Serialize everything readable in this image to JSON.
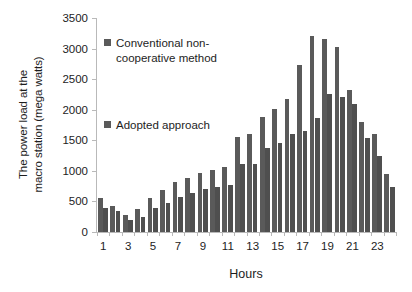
{
  "chart_data": {
    "type": "bar",
    "title": "",
    "xlabel": "Hours",
    "ylabel": "The power load at the macro station (mega watts)",
    "ylabel_line1": "The power load at the",
    "ylabel_line2": "macro station (mega watts)",
    "ylim": [
      0,
      3500
    ],
    "ytick_step": 500,
    "yticks": [
      0,
      500,
      1000,
      1500,
      2000,
      2500,
      3000,
      3500
    ],
    "categories": [
      1,
      2,
      3,
      4,
      5,
      6,
      7,
      8,
      9,
      10,
      11,
      12,
      13,
      14,
      15,
      16,
      17,
      18,
      19,
      20,
      21,
      22,
      23,
      24
    ],
    "xticklabels": [
      "1",
      "3",
      "5",
      "7",
      "9",
      "11",
      "13",
      "15",
      "17",
      "19",
      "21",
      "23"
    ],
    "xtick_positions": [
      1,
      3,
      5,
      7,
      9,
      11,
      13,
      15,
      17,
      19,
      21,
      23
    ],
    "grid": false,
    "legend_position": "inside-upper-left",
    "series": [
      {
        "name": "Conventional non-cooperative method",
        "color": "#5a5a5a",
        "values": [
          560,
          430,
          280,
          370,
          560,
          690,
          810,
          880,
          960,
          1020,
          1060,
          1560,
          1600,
          1880,
          2020,
          2180,
          2730,
          3200,
          3150,
          3030,
          2320,
          1800,
          1600,
          950
        ]
      },
      {
        "name": "Adopted approach",
        "color": "#4f4f4f",
        "values": [
          400,
          340,
          200,
          250,
          400,
          470,
          580,
          640,
          700,
          730,
          770,
          1120,
          1120,
          1380,
          1450,
          1600,
          1660,
          1870,
          2250,
          2210,
          2100,
          1540,
          1250,
          730
        ]
      }
    ]
  },
  "legend": {
    "conventional": "Conventional non-cooperative method",
    "conventional_line1": "Conventional non-",
    "conventional_line2": "cooperative method",
    "adopted": "Adopted approach"
  },
  "axes": {
    "x_title": "Hours"
  }
}
